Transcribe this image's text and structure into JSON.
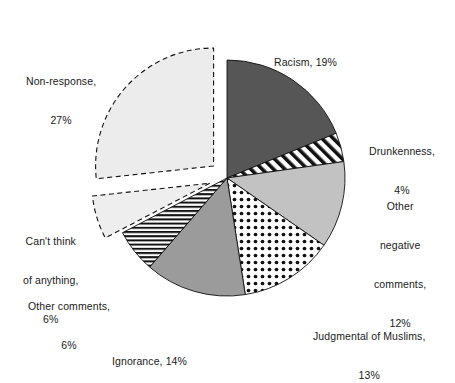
{
  "chart_data": {
    "type": "pie",
    "title": "",
    "subtitle": "",
    "xlabel": "",
    "ylabel": "",
    "legend_position": "none",
    "grid": false,
    "labels_inline": true,
    "start_angle_deg": 0,
    "direction": "clockwise",
    "categories": [
      "Racism",
      "Drunkenness",
      "Other negative comments",
      "Judgmental of Muslims",
      "Ignorance",
      "Other comments",
      "Can't think of anything",
      "Non-response"
    ],
    "values": [
      19,
      4,
      12,
      13,
      14,
      6,
      6,
      27
    ],
    "value_unit": "%",
    "slices": [
      {
        "name": "Racism",
        "value": 19,
        "label_text": "Racism, 19%",
        "label_lines": [
          "Racism, 19%"
        ],
        "fill": "#565656",
        "pattern": "solid",
        "exploded": false,
        "outline": "solid"
      },
      {
        "name": "Drunkenness",
        "value": 4,
        "label_text": "Drunkenness, 4%",
        "label_lines": [
          "Drunkenness,",
          "4%"
        ],
        "fill": "#ffffff",
        "pattern": "diagonal-stripes",
        "exploded": false,
        "outline": "solid"
      },
      {
        "name": "Other negative comments",
        "value": 12,
        "label_text": "Other negative comments, 12%",
        "label_lines": [
          "Other",
          "negative",
          "comments,",
          "12%"
        ],
        "fill": "#c2c2c2",
        "pattern": "solid",
        "exploded": false,
        "outline": "solid"
      },
      {
        "name": "Judgmental of Muslims",
        "value": 13,
        "label_text": "Judgmental of Muslims, 13%",
        "label_lines": [
          "Judgmental of Muslims,",
          "13%"
        ],
        "fill": "#ffffff",
        "pattern": "polka-dots",
        "exploded": false,
        "outline": "solid"
      },
      {
        "name": "Ignorance",
        "value": 14,
        "label_text": "Ignorance, 14%",
        "label_lines": [
          "Ignorance, 14%"
        ],
        "fill": "#9b9b9b",
        "pattern": "solid",
        "exploded": false,
        "outline": "solid"
      },
      {
        "name": "Other comments",
        "value": 6,
        "label_text": "Other comments, 6%",
        "label_lines": [
          "Other comments,",
          "6%"
        ],
        "fill": "#ffffff",
        "pattern": "horizontal-stripes",
        "exploded": false,
        "outline": "solid"
      },
      {
        "name": "Can't think of anything",
        "value": 6,
        "label_text": "Can't think of anything, 6%",
        "label_lines": [
          "Can't think",
          "of anything,",
          "6%"
        ],
        "fill": "#eeeeee",
        "pattern": "solid",
        "exploded": true,
        "outline": "dashed"
      },
      {
        "name": "Non-response",
        "value": 27,
        "label_text": "Non-response, 27%",
        "label_lines": [
          "Non-response,",
          "27%"
        ],
        "fill": "#ececec",
        "pattern": "solid",
        "exploded": true,
        "outline": "dashed"
      }
    ],
    "geometry": {
      "center_x": 227,
      "center_y": 178,
      "radius": 118
    },
    "colors": {
      "background": "#ffffff",
      "text": "#1a1a1a",
      "outline": "#111111"
    }
  },
  "labels": {
    "racism": "Racism, 19%",
    "drunkenness_l1": "Drunkenness,",
    "drunkenness_l2": "4%",
    "othernegative_l1": "Other",
    "othernegative_l2": "negative",
    "othernegative_l3": "comments,",
    "othernegative_l4": "12%",
    "judgmental_l1": "Judgmental of Muslims,",
    "judgmental_l2": "13%",
    "ignorance": "Ignorance, 14%",
    "othercomments_l1": "Other comments,",
    "othercomments_l2": "6%",
    "cantthink_l1": "Can't think",
    "cantthink_l2": "of anything,",
    "cantthink_l3": "6%",
    "nonresponse_l1": "Non-response,",
    "nonresponse_l2": "27%"
  }
}
